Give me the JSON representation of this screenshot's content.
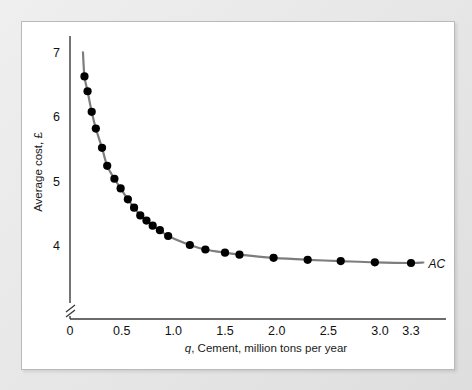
{
  "figure": {
    "background_color": "#ebebeb",
    "panel_color": "#ffffff",
    "border_color": "#b9b9b9"
  },
  "chart_data": {
    "type": "line",
    "title": "",
    "subtitle": "",
    "xlabel": "q, Cement, million tons per year",
    "xlabel_italic_prefix": "q",
    "xlabel_rest": ", Cement, million tons per year",
    "ylabel": "Average cost, £",
    "currency_symbol": "£",
    "xlim": [
      0,
      3.45
    ],
    "ylim": [
      3.45,
      7.3
    ],
    "y_axis_break": true,
    "grid": false,
    "legend_position": "right-end-of-line",
    "line_color": "#7d7d7d",
    "marker_color": "#000000",
    "marker_shape": "circle",
    "xticks": [
      0,
      0.5,
      1.0,
      1.5,
      2.0,
      2.5,
      3.0,
      3.3
    ],
    "xticklabels": [
      "0",
      "0.5",
      "1.0",
      "1.5",
      "2.0",
      "2.5",
      "3.0",
      "3.3"
    ],
    "yticks": [
      4,
      5,
      6,
      7
    ],
    "yticklabels": [
      "4",
      "5",
      "6",
      "7"
    ],
    "series": [
      {
        "name": "AC",
        "label": "AC",
        "label_style": "italic",
        "x": [
          0.14,
          0.17,
          0.21,
          0.25,
          0.31,
          0.36,
          0.43,
          0.49,
          0.56,
          0.62,
          0.68,
          0.74,
          0.8,
          0.87,
          0.95,
          1.16,
          1.31,
          1.5,
          1.64,
          1.97,
          2.3,
          2.62,
          2.95,
          3.3
        ],
        "y": [
          6.62,
          6.39,
          6.07,
          5.81,
          5.51,
          5.23,
          5.03,
          4.88,
          4.71,
          4.58,
          4.46,
          4.38,
          4.3,
          4.23,
          4.14,
          4.0,
          3.93,
          3.88,
          3.85,
          3.8,
          3.77,
          3.75,
          3.73,
          3.72
        ]
      }
    ],
    "annotations": [
      {
        "text": "AC",
        "x": 3.45,
        "y": 3.72,
        "style": "italic"
      }
    ]
  }
}
